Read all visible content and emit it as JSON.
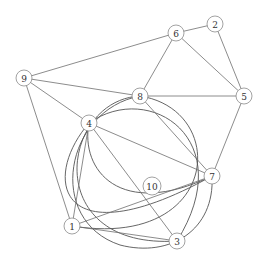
{
  "diagram": {
    "type": "graph",
    "width": 269,
    "height": 264,
    "colors": {
      "background": "#ffffff",
      "edge": "#6e6e6e",
      "node_stroke": "#8a8a8a",
      "label": "#333333"
    },
    "nodes": [
      {
        "id": "1",
        "label": "1",
        "x": 72,
        "y": 226,
        "r": 8
      },
      {
        "id": "2",
        "label": "2",
        "x": 215,
        "y": 24,
        "r": 8
      },
      {
        "id": "3",
        "label": "3",
        "x": 177,
        "y": 241,
        "r": 8
      },
      {
        "id": "4",
        "label": "4",
        "x": 89,
        "y": 123,
        "r": 8
      },
      {
        "id": "5",
        "label": "5",
        "x": 244,
        "y": 96,
        "r": 8
      },
      {
        "id": "6",
        "label": "6",
        "x": 176,
        "y": 33,
        "r": 8
      },
      {
        "id": "7",
        "label": "7",
        "x": 212,
        "y": 176,
        "r": 8
      },
      {
        "id": "8",
        "label": "8",
        "x": 140,
        "y": 96,
        "r": 8
      },
      {
        "id": "9",
        "label": "9",
        "x": 24,
        "y": 78,
        "r": 8
      },
      {
        "id": "10",
        "label": "10",
        "x": 152,
        "y": 186,
        "r": 9
      }
    ],
    "edges": [
      {
        "from": "9",
        "to": "6"
      },
      {
        "from": "9",
        "to": "8"
      },
      {
        "from": "9",
        "to": "4"
      },
      {
        "from": "9",
        "to": "1"
      },
      {
        "from": "6",
        "to": "2"
      },
      {
        "from": "6",
        "to": "5"
      },
      {
        "from": "6",
        "to": "8"
      },
      {
        "from": "2",
        "to": "5"
      },
      {
        "from": "8",
        "to": "5"
      },
      {
        "from": "8",
        "to": "7"
      },
      {
        "from": "5",
        "to": "7"
      },
      {
        "from": "4",
        "to": "7"
      },
      {
        "from": "4",
        "to": "3"
      },
      {
        "from": "4",
        "to": "1"
      },
      {
        "from": "1",
        "to": "3"
      },
      {
        "from": "1",
        "to": "7"
      }
    ],
    "arcs": [
      {
        "from": "8",
        "to": "3",
        "d": "M140,96 C60,100 40,250 177,241"
      },
      {
        "from": "8",
        "to": "1",
        "d": "M140,96 C230,110 220,250 72,226"
      },
      {
        "from": "4",
        "to": "7",
        "d": "M89,123 C40,180 60,260 212,176"
      },
      {
        "from": "8",
        "to": "7",
        "d": "M140,96 C65,110 45,220 120,245 C170,258 215,230 212,176"
      },
      {
        "from": "4",
        "to": "3",
        "d": "M89,123 C150,80 240,140 177,241"
      },
      {
        "from": "4",
        "to": "7b",
        "d": "M89,123 C80,170 120,220 212,176"
      }
    ]
  }
}
